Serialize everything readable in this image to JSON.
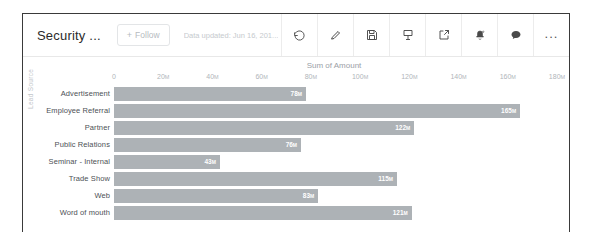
{
  "header": {
    "title": "Security ...",
    "follow_label": "Follow",
    "follow_plus": "+",
    "data_updated": "Data updated: Jun 16, 201...",
    "toolbar": [
      {
        "name": "refresh-icon",
        "label": "Refresh"
      },
      {
        "name": "edit-pencil-icon",
        "label": "Edit"
      },
      {
        "name": "save-floppy-icon",
        "label": "Save"
      },
      {
        "name": "subscribe-icon",
        "label": "Subscribe"
      },
      {
        "name": "share-export-icon",
        "label": "Share"
      },
      {
        "name": "notification-bell-icon",
        "label": "Notifications"
      },
      {
        "name": "chat-bubble-icon",
        "label": "Chat"
      },
      {
        "name": "more-options-icon",
        "label": "..."
      }
    ]
  },
  "chart_data": {
    "type": "bar",
    "orientation": "horizontal",
    "title": "Sum of Amount",
    "xlabel": "Sum of Amount",
    "ylabel": "Lead Source",
    "categories": [
      "Advertisement",
      "Employee Referral",
      "Partner",
      "Public Relations",
      "Seminar - Internal",
      "Trade Show",
      "Web",
      "Word of mouth"
    ],
    "values": [
      78,
      165,
      122,
      76,
      43,
      115,
      83,
      121
    ],
    "value_labels": [
      "78M",
      "165M",
      "122M",
      "76M",
      "43M",
      "115M",
      "83M",
      "121M"
    ],
    "unit_suffix": "M",
    "xlim": [
      0,
      180
    ],
    "xticks": [
      0,
      20,
      40,
      60,
      80,
      100,
      120,
      140,
      160,
      180
    ],
    "xtick_labels": [
      "0",
      "20M",
      "40M",
      "60M",
      "80M",
      "100M",
      "120M",
      "140M",
      "160M",
      "180M"
    ],
    "grid": false,
    "legend": "none",
    "bar_color": "#adb2b6"
  }
}
